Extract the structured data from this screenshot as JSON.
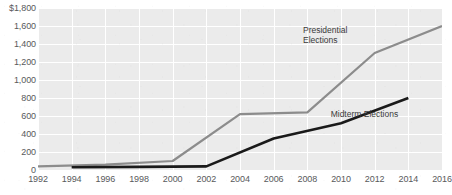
{
  "chart_data": {
    "type": "line",
    "title": "",
    "subtitle": "",
    "xlabel": "",
    "ylabel": "",
    "x": [
      1992,
      1994,
      1996,
      1998,
      2000,
      2002,
      2004,
      2006,
      2008,
      2010,
      2012,
      2014,
      2016
    ],
    "xticklabels": [
      "1992",
      "1994",
      "1996",
      "1998",
      "2000",
      "2002",
      "2004",
      "2006",
      "2008",
      "2010",
      "2012",
      "2014",
      "2016"
    ],
    "yticklabels": [
      "$1,800",
      "1,600",
      "1,400",
      "1,200",
      "1,000",
      "800",
      "600",
      "400",
      "200",
      "0"
    ],
    "yticks": [
      1800,
      1600,
      1400,
      1200,
      1000,
      800,
      600,
      400,
      200,
      0
    ],
    "ylim": [
      0,
      1800
    ],
    "xlim": [
      1992,
      2016
    ],
    "grid": true,
    "legend_position": "inline-annotation",
    "series": [
      {
        "name": "Presidential Elections",
        "color": "#8c8c8c",
        "x": [
          1992,
          1996,
          2000,
          2004,
          2008,
          2012,
          2016
        ],
        "values": [
          40,
          60,
          100,
          620,
          640,
          1300,
          1600
        ]
      },
      {
        "name": "Midterm Elections",
        "color": "#1a1a1a",
        "x": [
          1994,
          1998,
          2002,
          2006,
          2010,
          2014
        ],
        "values": [
          30,
          35,
          40,
          350,
          520,
          800
        ]
      }
    ],
    "annotations": [
      {
        "text": "Presidential\nElections",
        "x": 2010,
        "y": 1560
      },
      {
        "text": "Midterm Elections",
        "x": 2012,
        "y": 620
      }
    ]
  },
  "colors": {
    "plot_background": "#ebebeb",
    "gridline": "#ffffff",
    "tick_text": "#58595b",
    "presidential_line": "#8c8c8c",
    "midterm_line": "#1a1a1a"
  }
}
